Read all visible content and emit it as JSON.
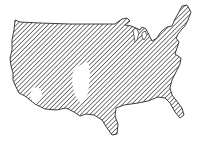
{
  "map": {
    "subject": "Contiguous United States",
    "fill_style": "diagonal-hatch",
    "colors": {
      "background": "#ffffff",
      "hatch": "#3a3a3a",
      "outline": "#2a2a2a",
      "unshaded": "#ffffff"
    },
    "regions": [
      {
        "name": "shaded-area",
        "style": "hatched"
      },
      {
        "name": "unshaded-area-central-plains",
        "style": "blank"
      },
      {
        "name": "unshaded-area-southwest",
        "style": "blank"
      }
    ]
  }
}
